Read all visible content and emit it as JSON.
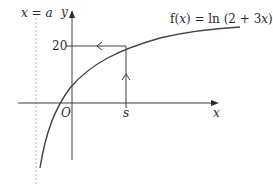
{
  "figure": {
    "type": "function-graph",
    "function_label": "f(x) = ln (2 + 3x)",
    "function_label_parts": {
      "prefix": "f(",
      "var": "x",
      "mid": ") = ln (2 + 3",
      "var2": "x",
      "suffix": ")"
    },
    "asymptote_label": "x = a",
    "asymptote_label_parts": {
      "var": "x",
      "eq": " = ",
      "val": "a"
    },
    "axes": {
      "x_label": "x",
      "y_label": "y",
      "origin_label": "O"
    },
    "ticks": {
      "y_value_label": "20",
      "x_value_label": "s"
    },
    "annotations": [
      "vertical dashed asymptote at x = a",
      "vertical arrow up from x = s to curve",
      "horizontal arrow left from curve to y = 20"
    ]
  },
  "colors": {
    "ink": "#2a2a2a",
    "curve": "#444444",
    "asymptote": "#b5b5b5",
    "background": "#ffffff"
  }
}
